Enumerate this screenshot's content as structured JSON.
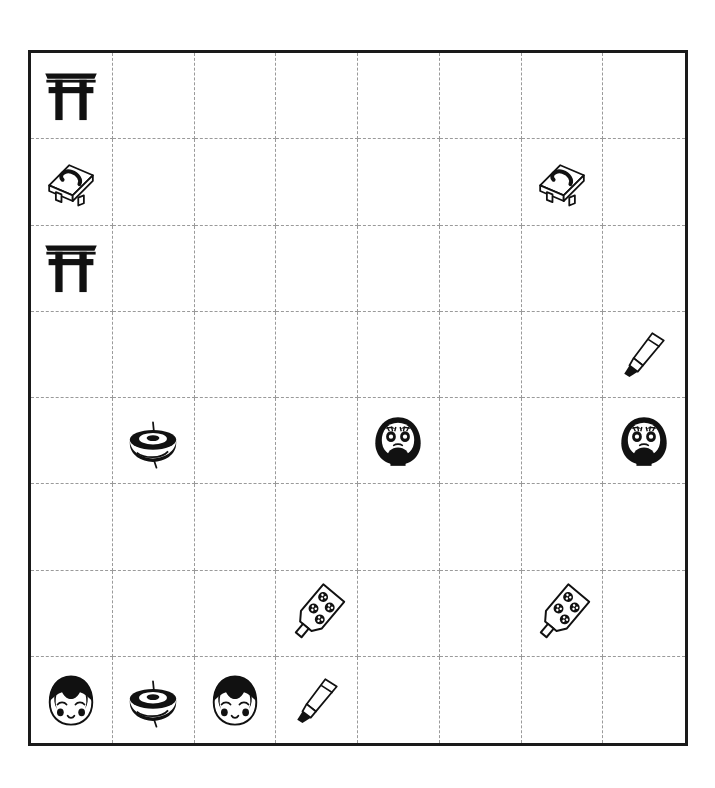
{
  "board": {
    "name": "japanese-culture-icon-grid",
    "columns": 8,
    "rows": 8,
    "border_color": "#1a1a1a",
    "gridline_color": "#9a9a9a",
    "gridline_style": "dashed",
    "background_color": "#ffffff",
    "ink_color": "#111111"
  },
  "legend": {
    "torii": "torii-gate-icon",
    "geta": "geta-sandal-icon",
    "brush": "calligraphy-brush-icon",
    "top": "spinning-top-icon",
    "daruma": "daruma-doll-icon",
    "hagoita": "hagoita-paddle-icon",
    "kokeshi": "kokeshi-doll-icon",
    "empty": "empty-cell"
  },
  "chart_data": {
    "type": "heatmap",
    "title": "",
    "xlabel": "",
    "ylabel": "",
    "categories": [
      "c0",
      "c1",
      "c2",
      "c3",
      "c4",
      "c5",
      "c6",
      "c7"
    ],
    "rows": [
      "r0",
      "r1",
      "r2",
      "r3",
      "r4",
      "r5",
      "r6",
      "r7"
    ],
    "grid": [
      [
        "torii",
        "empty",
        "empty",
        "empty",
        "empty",
        "empty",
        "empty",
        "empty"
      ],
      [
        "geta",
        "empty",
        "empty",
        "empty",
        "empty",
        "empty",
        "geta",
        "empty"
      ],
      [
        "torii",
        "empty",
        "empty",
        "empty",
        "empty",
        "empty",
        "empty",
        "empty"
      ],
      [
        "empty",
        "empty",
        "empty",
        "empty",
        "empty",
        "empty",
        "empty",
        "brush"
      ],
      [
        "empty",
        "top",
        "empty",
        "empty",
        "daruma",
        "empty",
        "empty",
        "daruma"
      ],
      [
        "empty",
        "empty",
        "empty",
        "empty",
        "empty",
        "empty",
        "empty",
        "empty"
      ],
      [
        "empty",
        "empty",
        "empty",
        "hagoita",
        "empty",
        "empty",
        "hagoita",
        "empty"
      ],
      [
        "kokeshi",
        "top",
        "kokeshi",
        "brush",
        "empty",
        "empty",
        "empty",
        "empty"
      ]
    ],
    "counts": {
      "torii": 2,
      "geta": 2,
      "brush": 2,
      "top": 2,
      "daruma": 2,
      "hagoita": 2,
      "kokeshi": 2,
      "empty": 50
    }
  }
}
